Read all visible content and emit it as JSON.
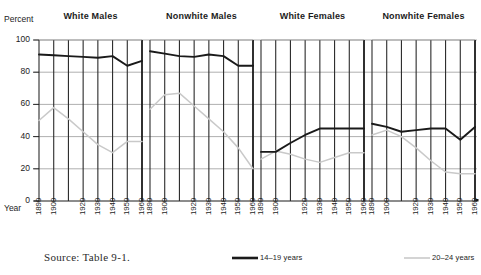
{
  "figure": {
    "y_axis_title": "Percent",
    "x_axis_title": "Year",
    "source_note": "Source:  Table 9-1."
  },
  "legend": {
    "position": "bottom",
    "entries": [
      {
        "label": "14–19 years",
        "color": "#1a1a1a",
        "style": "thick-dark"
      },
      {
        "label": "20–24 years",
        "color": "#c9c9c9",
        "style": "thin-light"
      }
    ]
  },
  "chart_data": {
    "type": "line",
    "title": "",
    "subtitle": "",
    "xlabel": "Year",
    "ylabel": "Percent",
    "ylim": [
      0,
      100
    ],
    "yticks": [
      0,
      20,
      40,
      60,
      80,
      100
    ],
    "ytick_labels": [
      "0",
      "20",
      "40",
      "60",
      "80",
      "100"
    ],
    "x": [
      1890,
      1900,
      1910,
      1920,
      1930,
      1940,
      1950,
      1960
    ],
    "xtick_labels": [
      "1890",
      "1900",
      "1920",
      "1930",
      "1940",
      "1950",
      "1960"
    ],
    "xticks_shown": [
      1890,
      1900,
      1920,
      1930,
      1940,
      1950,
      1960
    ],
    "grid": true,
    "grid_vertical": true,
    "legend_position": "bottom",
    "panels": [
      {
        "name": "White Males",
        "series": [
          {
            "name": "14–19 years",
            "color": "#1a1a1a",
            "values": [
              91,
              90.5,
              90,
              89.5,
              89,
              90,
              84,
              87
            ]
          },
          {
            "name": "20–24 years",
            "color": "#c9c9c9",
            "values": [
              50,
              58,
              51,
              43,
              35,
              30,
              37,
              37
            ]
          }
        ]
      },
      {
        "name": "Nonwhite Males",
        "series": [
          {
            "name": "14–19 years",
            "color": "#1a1a1a",
            "values": [
              93,
              91.5,
              90,
              89.5,
              91,
              90,
              84,
              84
            ]
          },
          {
            "name": "20–24 years",
            "color": "#c9c9c9",
            "values": [
              57,
              66,
              67,
              59,
              51,
              43,
              33,
              20
            ]
          }
        ]
      },
      {
        "name": "White Females",
        "series": [
          {
            "name": "14–19 years",
            "color": "#1a1a1a",
            "values": [
              30.5,
              30.5,
              36,
              41,
              45,
              45,
              45,
              45
            ]
          },
          {
            "name": "20–24 years",
            "color": "#c9c9c9",
            "values": [
              26,
              31,
              29,
              26,
              24,
              27,
              30,
              30
            ]
          }
        ]
      },
      {
        "name": "Nonwhite Females",
        "series": [
          {
            "name": "14–19 years",
            "color": "#1a1a1a",
            "values": [
              48,
              46,
              43,
              44,
              45,
              45,
              38,
              46
            ]
          },
          {
            "name": "20–24 years",
            "color": "#c9c9c9",
            "values": [
              41,
              44,
              40,
              33,
              25,
              18,
              17,
              17
            ]
          }
        ]
      }
    ]
  }
}
